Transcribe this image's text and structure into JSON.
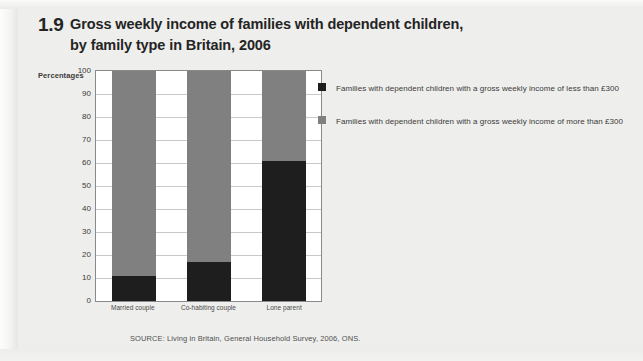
{
  "figure": {
    "number": "1.9",
    "title": "Gross weekly income of families with dependent children, by family type in Britain, 2006"
  },
  "axis": {
    "y_caption": "Percentages",
    "y_ticks": [
      "100",
      "90",
      "80",
      "70",
      "60",
      "50",
      "40",
      "30",
      "20",
      "10",
      "0"
    ]
  },
  "legend": {
    "items": [
      {
        "swatch_name": "legend-swatch-less-than-300",
        "color": "#1e1e1e",
        "text": "Families with dependent children with a gross weekly income of less than £300"
      },
      {
        "swatch_name": "legend-swatch-more-than-300",
        "color": "#808080",
        "text": "Families with dependent children with a gross weekly income of more than £300"
      }
    ]
  },
  "source": {
    "note": "SOURCE: Living in Britain, General Household Survey, 2006, ONS."
  },
  "chart_data": {
    "type": "bar",
    "subtype": "stacked-100-percent",
    "title": "Gross weekly income of families with dependent children, by family type in Britain, 2006",
    "xlabel": "",
    "ylabel": "Percentages",
    "ylim": [
      0,
      100
    ],
    "ytick_step": 10,
    "grid": true,
    "legend_position": "right",
    "categories": [
      "Married couple",
      "Co-habiting couple",
      "Lone parent"
    ],
    "series": [
      {
        "name": "Families with dependent children with a gross weekly income of less than £300",
        "color": "#1e1e1e",
        "values": [
          11,
          17,
          61
        ]
      },
      {
        "name": "Families with dependent children with a gross weekly income of more than £300",
        "color": "#808080",
        "values": [
          89,
          83,
          39
        ]
      }
    ],
    "source": "SOURCE: Living in Britain, General Household Survey, 2006, ONS."
  }
}
